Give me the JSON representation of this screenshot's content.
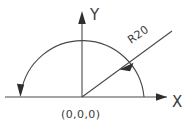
{
  "diagram": {
    "type": "cad-arc-sketch",
    "title": "",
    "background_color": "#ffffff",
    "line_color": "#4a4a4a",
    "text_color": "#3a3a3a",
    "axes": {
      "x_label": "X",
      "y_label": "Y",
      "x_axis_name": "x-axis",
      "y_axis_name": "y-axis",
      "x_arrow_direction": "right",
      "y_arrow_direction": "up"
    },
    "origin": {
      "label": "(0,0,0)",
      "x": 82,
      "y": 97
    },
    "arc": {
      "name": "semicircular-arc",
      "radius_label": "R20",
      "radius_value": 20,
      "sweep_degrees": 180,
      "start_angle_degrees": 0,
      "end_angle_degrees": 180,
      "direction": "counterclockwise",
      "end_arrow_direction": "down"
    },
    "radius_leader": {
      "name": "radius-leader-line",
      "label": "R20",
      "label_rotation_degrees": -35,
      "arrow_direction": "down-left"
    }
  }
}
